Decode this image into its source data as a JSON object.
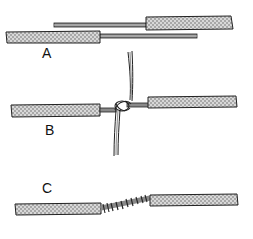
{
  "figure": {
    "panels": [
      {
        "id": "A",
        "label": "A",
        "description": "two stripped wires laid parallel, overlapping bare conductors"
      },
      {
        "id": "B",
        "label": "B",
        "description": "bare conductors crossed and hooked together at center"
      },
      {
        "id": "C",
        "label": "C",
        "description": "conductors wrapped into finished twisted splice"
      }
    ],
    "colors": {
      "insulation_fill": "#c8c8c8",
      "insulation_outline": "#222222",
      "conductor": "#777777",
      "ink": "#111111",
      "background": "#ffffff"
    }
  }
}
